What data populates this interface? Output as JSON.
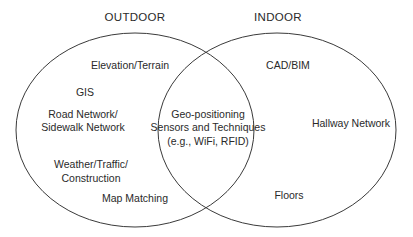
{
  "diagram": {
    "type": "venn",
    "sets": [
      {
        "id": "outdoor",
        "title": "OUTDOOR",
        "items": [
          "Elevation/Terrain",
          "GIS",
          "Road Network/\nSidewalk Network",
          "Weather/Traffic/\nConstruction",
          "Map Matching"
        ]
      },
      {
        "id": "indoor",
        "title": "INDOOR",
        "items": [
          "CAD/BIM",
          "Hallway Network",
          "Floors"
        ]
      }
    ],
    "intersection": {
      "lines": [
        "Geo-positioning",
        "Sensors and Techniques",
        "(e.g., WiFi, RFID)"
      ]
    },
    "stroke_color": "#3a3a3a"
  },
  "labels": {
    "outdoor_title": "OUTDOOR",
    "indoor_title": "INDOOR",
    "elevation": "Elevation/Terrain",
    "gis": "GIS",
    "road_line1": "Road Network/",
    "road_line2": "Sidewalk Network",
    "weather_line1": "Weather/Traffic/",
    "weather_line2": "Construction",
    "map_matching": "Map Matching",
    "cad_bim": "CAD/BIM",
    "hallway": "Hallway Network",
    "floors": "Floors",
    "geo_line1": "Geo-positioning",
    "geo_line2": "Sensors and Techniques",
    "geo_line3": "(e.g., WiFi, RFID)"
  }
}
